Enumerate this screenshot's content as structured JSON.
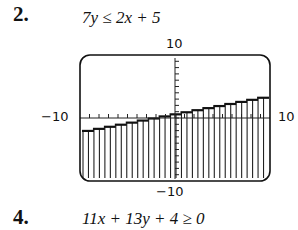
{
  "problems": [
    {
      "number": "2.",
      "inequality": "7y ≤ 2x + 5"
    },
    {
      "number": "4.",
      "inequality": "11x + 13y + 4 ≥ 0"
    }
  ],
  "graph": {
    "ymax_label": "10",
    "ymin_label": "−10",
    "xmin_label": "−10",
    "xmax_label": "10"
  },
  "chart_data": {
    "type": "area",
    "title": "7y ≤ 2x + 5",
    "xlabel": "",
    "ylabel": "",
    "xlim": [
      -10,
      10
    ],
    "ylim": [
      -10,
      10
    ],
    "grid": false,
    "boundary_line": {
      "slope": 0.2857,
      "intercept": 0.7143
    },
    "x": [
      -10,
      -5,
      0,
      5,
      10
    ],
    "values": [
      -2.14,
      -0.71,
      0.71,
      2.14,
      3.57
    ],
    "shading": "below",
    "tick_marks": "every 1 unit on both axes"
  }
}
